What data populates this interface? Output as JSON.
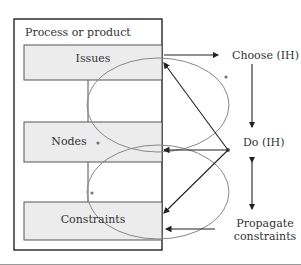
{
  "diagram": {
    "frame_title": "Process or product",
    "boxes": [
      {
        "id": "issues",
        "label": "Issues"
      },
      {
        "id": "nodes",
        "label": "Nodes"
      },
      {
        "id": "constraints",
        "label": "Constraints"
      }
    ],
    "steps": [
      {
        "id": "choose",
        "label": "Choose (IH)"
      },
      {
        "id": "do",
        "label": "Do (IH)"
      },
      {
        "id": "propagate",
        "label_line1": "Propagate",
        "label_line2": "constraints"
      }
    ],
    "colors": {
      "box_fill": "#ececec",
      "box_stroke": "#555555",
      "frame_stroke": "#222222",
      "ellipse_stroke": "#888888",
      "arrow_stroke": "#222222"
    }
  }
}
